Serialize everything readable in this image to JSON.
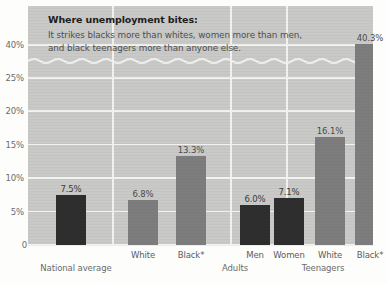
{
  "chart_data": {
    "type": "bar",
    "title": "Where unemployment bites:",
    "subtitle": "It strikes blacks more than whites, women more than men, and black teenagers more than anyone else.",
    "xlabel": "",
    "ylabel": "",
    "ylim": [
      0,
      42
    ],
    "grid": true,
    "legend": false,
    "axis_break": {
      "present": true,
      "between": [
        25,
        40
      ],
      "style": "wavy"
    },
    "ytick_labels": [
      "40%",
      "25%",
      "20%",
      "15%",
      "10%",
      "5%",
      "0"
    ],
    "ytick_values": [
      40,
      25,
      20,
      15,
      10,
      5,
      0
    ],
    "groups": [
      {
        "name": "National average",
        "bars": [
          {
            "category": "",
            "value": 7.5,
            "label": "7.5%",
            "shade": "dark"
          }
        ]
      },
      {
        "name": "Adults",
        "bars": [
          {
            "category": "White",
            "value": 6.8,
            "label": "6.8%",
            "shade": "mid"
          },
          {
            "category": "Black*",
            "value": 13.3,
            "label": "13.3%",
            "shade": "mid"
          }
        ]
      },
      {
        "name": "Adults",
        "bars": [
          {
            "category": "Men",
            "value": 6.0,
            "label": "6.0%",
            "shade": "dark"
          },
          {
            "category": "Women",
            "value": 7.1,
            "label": "7.1%",
            "shade": "dark"
          }
        ]
      },
      {
        "name": "Teenagers",
        "bars": [
          {
            "category": "White",
            "value": 16.1,
            "label": "16.1%",
            "shade": "mid"
          },
          {
            "category": "Black*",
            "value": 40.3,
            "label": "40.3%",
            "shade": "mid"
          }
        ]
      }
    ],
    "categories": [
      "National average",
      "White",
      "Black*",
      "Men",
      "Women",
      "White",
      "Black*"
    ],
    "values": [
      7.5,
      6.8,
      13.3,
      6.0,
      7.1,
      16.1,
      40.3
    ],
    "colors": {
      "plot_background": "#c9c9c7",
      "gridline": "#f2f2f0",
      "bar_dark": "#2e2e2e",
      "bar_mid": "#7d7d7d",
      "page_background": "#fdfdfc",
      "text": "#3a3a3a"
    }
  }
}
